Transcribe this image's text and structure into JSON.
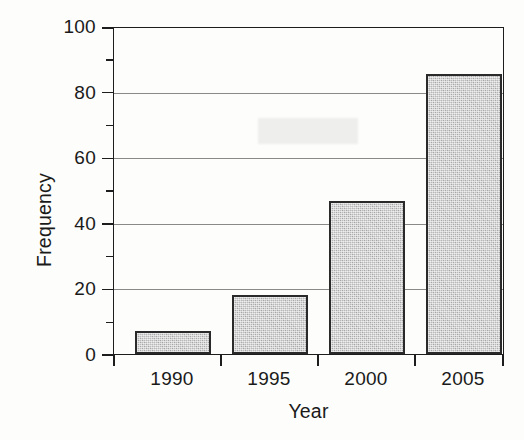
{
  "chart_data": {
    "type": "bar",
    "title": "",
    "xlabel": "Year",
    "ylabel": "Frequency",
    "categories": [
      "1990",
      "1995",
      "2000",
      "2005"
    ],
    "values": [
      7,
      18,
      47,
      86
    ],
    "ylim": [
      0,
      100
    ],
    "y_major_ticks": [
      0,
      20,
      40,
      60,
      80,
      100
    ],
    "y_tick_labels": [
      "0",
      "20",
      "40",
      "60",
      "80",
      "100"
    ],
    "y_minor_ticks": [
      10,
      30,
      50,
      70,
      90
    ],
    "grid": {
      "horizontal": true,
      "vertical": false,
      "gridline_values": [
        20,
        40,
        60,
        80,
        100
      ]
    },
    "legend": null,
    "legend_position": "none",
    "bar_fill_color": "#b9b9b9",
    "bar_edge_color": "#2a2a2a",
    "axis_color": "#1d1d1d",
    "background_color": "#fdfdfb",
    "series": [
      {
        "name": "Frequency",
        "values": [
          7,
          18,
          47,
          86
        ]
      }
    ]
  }
}
